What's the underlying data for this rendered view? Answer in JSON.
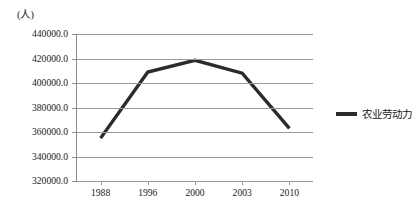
{
  "unit_label": "(人)",
  "legend": {
    "entries": [
      {
        "label": "农业劳动力",
        "color": "#2b2b2b"
      }
    ]
  },
  "axes": {
    "y_tick_labels": [
      "440000.0",
      "420000.0",
      "400000.0",
      "380000.0",
      "360000.0",
      "340000.0",
      "320000.0"
    ],
    "x_tick_labels": [
      "1988",
      "1996",
      "2000",
      "2003",
      "2010"
    ]
  },
  "chart_data": {
    "type": "line",
    "title": "",
    "subtitle": "",
    "xlabel": "",
    "ylabel": "(人)",
    "categories": [
      "1988",
      "1996",
      "2000",
      "2003",
      "2010"
    ],
    "series": [
      {
        "name": "农业劳动力",
        "color": "#2b2b2b",
        "values": [
          355000,
          409000,
          418500,
          408000,
          363000
        ]
      }
    ],
    "ylim": [
      320000,
      440000
    ],
    "y_tick_step": 20000,
    "y_tick_values": [
      320000,
      340000,
      360000,
      380000,
      400000,
      420000,
      440000
    ],
    "grid": "horizontal",
    "legend_position": "right",
    "annotations": []
  }
}
